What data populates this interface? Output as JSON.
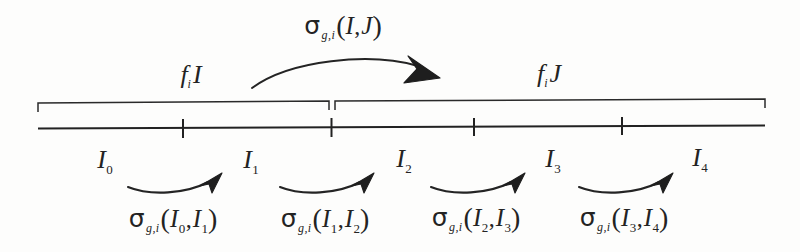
{
  "figure": {
    "caption_role": "energy-group-to-isotope-transfer-cross-section-diagram",
    "background_color": "#fdfdfc",
    "ink_color": "#232323"
  },
  "top": {
    "transfer_label": {
      "sigma": "σ",
      "subscript": "g,i",
      "open_paren": "(",
      "arg1": "I",
      "comma": ",",
      "arg2": "J",
      "close_paren": ")",
      "plain_text": "σg,i(I,J)"
    },
    "arrow_name": "group-transfer-arrow"
  },
  "groups": [
    {
      "id": "group-I",
      "f_char": "f",
      "f_sub": "i",
      "main": "I",
      "plain_text": "fi I",
      "x_center": 191,
      "bracket_start": 38,
      "bracket_end": 331
    },
    {
      "id": "group-J",
      "f_char": "f",
      "f_sub": "i",
      "main": "J",
      "plain_text": "fi J",
      "x_center": 549,
      "bracket_start": 334,
      "bracket_end": 765
    }
  ],
  "axis": {
    "x_start": 38,
    "x_end": 765,
    "y": 127,
    "tick_positions": [
      183,
      331,
      474,
      622
    ]
  },
  "nodes": [
    {
      "label_char": "I",
      "sub": "0",
      "plain_text": "I0",
      "x": 105
    },
    {
      "label_char": "I",
      "sub": "1",
      "plain_text": "I1",
      "x": 251
    },
    {
      "label_char": "I",
      "sub": "2",
      "plain_text": "I2",
      "x": 404
    },
    {
      "label_char": "I",
      "sub": "3",
      "plain_text": "I3",
      "x": 553
    },
    {
      "label_char": "I",
      "sub": "4",
      "plain_text": "I4",
      "x": 700
    }
  ],
  "transitions": [
    {
      "sigma": "σ",
      "subscript": "g,i",
      "open_paren": "(",
      "arg1": "I",
      "arg1_sub": "0",
      "comma": ",",
      "arg2": "I",
      "arg2_sub": "1",
      "close_paren": ")",
      "plain_text": "σg,i(I0,I1)",
      "x_center": 173,
      "arrow_from": 125,
      "arrow_to": 225
    },
    {
      "sigma": "σ",
      "subscript": "g,i",
      "open_paren": "(",
      "arg1": "I",
      "arg1_sub": "1",
      "comma": ",",
      "arg2": "I",
      "arg2_sub": "2",
      "close_paren": ")",
      "plain_text": "σg,i(I1,I2)",
      "x_center": 325,
      "arrow_from": 277,
      "arrow_to": 377
    },
    {
      "sigma": "σ",
      "subscript": "g,i",
      "open_paren": "(",
      "arg1": "I",
      "arg1_sub": "2",
      "comma": ",",
      "arg2": "I",
      "arg2_sub": "3",
      "close_paren": ")",
      "plain_text": "σg,i(I2,I3)",
      "x_center": 476,
      "arrow_from": 428,
      "arrow_to": 528
    },
    {
      "sigma": "σ",
      "subscript": "g,i",
      "open_paren": "(",
      "arg1": "I",
      "arg1_sub": "3",
      "comma": ",",
      "arg2": "I",
      "arg2_sub": "4",
      "close_paren": ")",
      "plain_text": "σg,i(I3,I4)",
      "x_center": 624,
      "arrow_from": 576,
      "arrow_to": 676
    }
  ]
}
